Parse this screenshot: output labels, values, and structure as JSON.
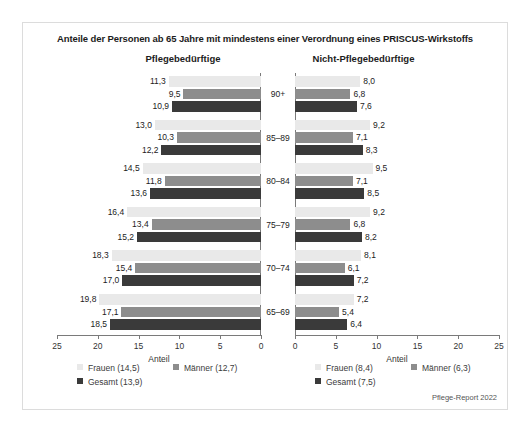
{
  "chart_data": {
    "type": "bar",
    "title": "Anteile der Personen ab 65 Jahre mit mindestens einer Verordnung eines PRISCUS-Wirkstoffs",
    "orientation": "horizontal",
    "xlabel": "Anteil",
    "ylabel": "",
    "grid": false,
    "legend_position": "bottom",
    "categories": [
      "90+",
      "85–89",
      "80–84",
      "75–79",
      "70–74",
      "65–69"
    ],
    "panels": [
      {
        "name": "left",
        "heading": "Pflegebedürftige",
        "axis_title": "Anteil",
        "xlim": [
          0,
          25
        ],
        "xticks": [
          25,
          20,
          15,
          10,
          5,
          0
        ],
        "direction": "right-to-left",
        "series": [
          {
            "name": "Frauen",
            "total": "14,5",
            "legend": "Frauen (14,5)",
            "color": "#e9e9e9",
            "values": [
              11.3,
              13.0,
              14.5,
              16.4,
              18.3,
              19.8
            ],
            "labels": [
              "11,3",
              "13,0",
              "14,5",
              "16,4",
              "18,3",
              "19,8"
            ]
          },
          {
            "name": "Männer",
            "total": "12,7",
            "legend": "Männer (12,7)",
            "color": "#8d8d8d",
            "values": [
              9.5,
              10.3,
              11.8,
              13.4,
              15.4,
              17.1
            ],
            "labels": [
              "9,5",
              "10,3",
              "11,8",
              "13,4",
              "15,4",
              "17,1"
            ]
          },
          {
            "name": "Gesamt",
            "total": "13,9",
            "legend": "Gesamt (13,9)",
            "color": "#3a3a3a",
            "values": [
              10.9,
              12.2,
              13.6,
              15.2,
              17.0,
              18.5
            ],
            "labels": [
              "10,9",
              "12,2",
              "13,6",
              "15,2",
              "17,0",
              "18,5"
            ]
          }
        ]
      },
      {
        "name": "right",
        "heading": "Nicht-Pflegebedürftige",
        "axis_title": "Anteil",
        "xlim": [
          0,
          25
        ],
        "xticks": [
          0,
          5,
          10,
          15,
          20,
          25
        ],
        "direction": "left-to-right",
        "series": [
          {
            "name": "Frauen",
            "total": "8,4",
            "legend": "Frauen (8,4)",
            "color": "#e9e9e9",
            "values": [
              8.0,
              9.2,
              9.5,
              9.2,
              8.1,
              7.2
            ],
            "labels": [
              "8,0",
              "9,2",
              "9,5",
              "9,2",
              "8,1",
              "7,2"
            ]
          },
          {
            "name": "Männer",
            "total": "6,3",
            "legend": "Männer (6,3)",
            "color": "#8d8d8d",
            "values": [
              6.8,
              7.1,
              7.1,
              6.8,
              6.1,
              5.4
            ],
            "labels": [
              "6,8",
              "7,1",
              "7,1",
              "6,8",
              "6,1",
              "5,4"
            ]
          },
          {
            "name": "Gesamt",
            "total": "7,5",
            "legend": "Gesamt (7,5)",
            "color": "#3a3a3a",
            "values": [
              7.6,
              8.3,
              8.5,
              8.2,
              7.2,
              6.4
            ],
            "labels": [
              "7,6",
              "8,3",
              "8,5",
              "8,2",
              "7,2",
              "6,4"
            ]
          }
        ]
      }
    ],
    "source_note": "Pflege-Report 2022",
    "colors": {
      "frauen": "#e9e9e9",
      "maenner": "#8d8d8d",
      "gesamt": "#3a3a3a",
      "axis": "#7a7a7a",
      "border": "#dcdcdc",
      "text": "#1c1c1c"
    }
  }
}
